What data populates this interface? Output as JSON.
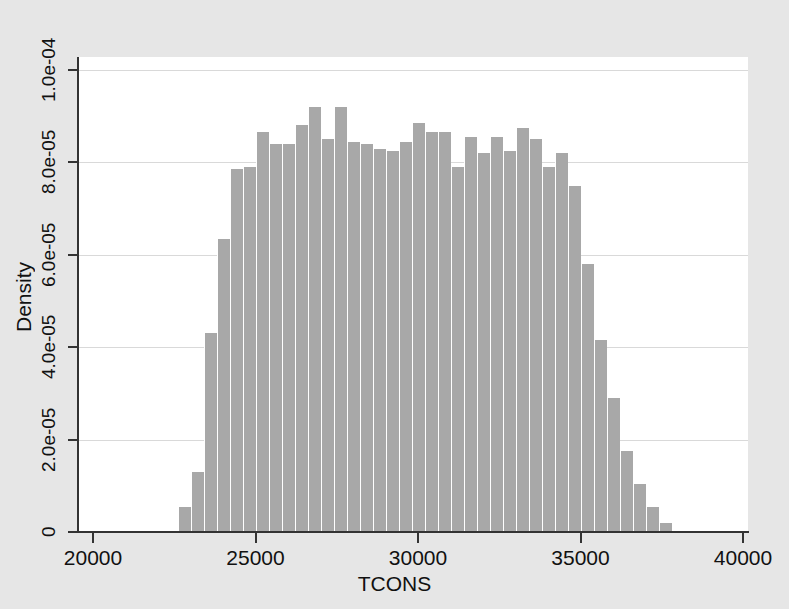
{
  "figure": {
    "background_color": "#e6e6e6",
    "plot_background_color": "#ffffff",
    "bar_color": "#a8a8a8",
    "axis_color": "#333333",
    "grid_color": "#d9d9d9"
  },
  "axes": {
    "x_title": "TCONS",
    "y_title": "Density",
    "x_ticks": [
      "20000",
      "25000",
      "30000",
      "35000",
      "40000"
    ],
    "y_ticks": [
      "0",
      "2.0e-05",
      "4.0e-05",
      "6.0e-05",
      "8.0e-05",
      "1.0e-04"
    ]
  },
  "chart_data": {
    "type": "bar",
    "title": "",
    "subtitle": "",
    "xlabel": "TCONS",
    "ylabel": "Density",
    "xlim": [
      20000,
      40000
    ],
    "ylim": [
      0,
      0.0001
    ],
    "xticks": [
      20000,
      25000,
      30000,
      35000,
      40000
    ],
    "yticks": [
      0,
      2e-05,
      4e-05,
      6e-05,
      8e-05,
      0.0001
    ],
    "ytick_labels": [
      "0",
      "2.0e-05",
      "4.0e-05",
      "6.0e-05",
      "8.0e-05",
      "1.0e-04"
    ],
    "xtick_labels": [
      "20000",
      "25000",
      "30000",
      "35000",
      "40000"
    ],
    "grid": true,
    "grid_axis": "y",
    "legend": null,
    "bin_width": 400,
    "bin_start": 22600,
    "bin_edges": [
      22600,
      23000,
      23400,
      23800,
      24200,
      24600,
      25000,
      25400,
      25800,
      26200,
      26600,
      27000,
      27400,
      27800,
      28200,
      28600,
      29000,
      29400,
      29800,
      30200,
      30600,
      31000,
      31400,
      31800,
      32200,
      32600,
      33000,
      33400,
      33800,
      34200,
      34600,
      35000,
      35400,
      35800,
      36200,
      36600,
      37000,
      37400,
      37800
    ],
    "bin_centers": [
      22800,
      23200,
      23600,
      24000,
      24400,
      24800,
      25200,
      25600,
      26000,
      26400,
      26800,
      27200,
      27600,
      28000,
      28400,
      28800,
      29200,
      29600,
      30000,
      30400,
      30800,
      31200,
      31600,
      32000,
      32400,
      32800,
      33200,
      33600,
      34000,
      34400,
      34800,
      35200,
      35600,
      36000,
      36400,
      36800,
      37200,
      37600
    ],
    "values": [
      5.5e-06,
      1.3e-05,
      4.3e-05,
      6.35e-05,
      7.85e-05,
      7.9e-05,
      8.65e-05,
      8.4e-05,
      8.4e-05,
      8.8e-05,
      9.2e-05,
      8.5e-05,
      9.2e-05,
      8.45e-05,
      8.4e-05,
      8.3e-05,
      8.25e-05,
      8.45e-05,
      8.85e-05,
      8.65e-05,
      8.65e-05,
      7.9e-05,
      8.55e-05,
      8.2e-05,
      8.55e-05,
      8.25e-05,
      8.75e-05,
      8.5e-05,
      7.9e-05,
      8.2e-05,
      7.5e-05,
      5.8e-05,
      4.15e-05,
      2.9e-05,
      1.75e-05,
      1.05e-05,
      5.5e-06,
      2e-06
    ]
  }
}
